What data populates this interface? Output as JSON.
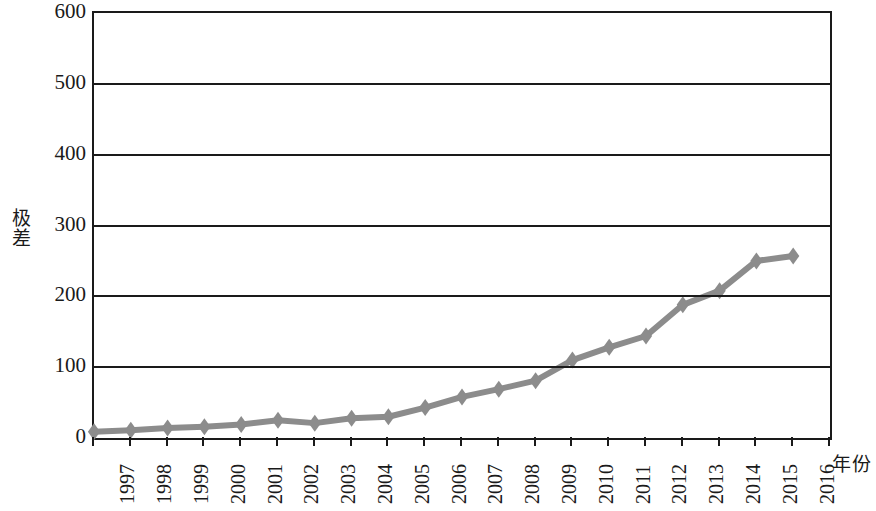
{
  "chart_data": {
    "type": "line",
    "title": "",
    "subtitle": "",
    "xlabel": "年份",
    "ylabel": "极差",
    "categories": [
      "1997",
      "1998",
      "1999",
      "2000",
      "2001",
      "2002",
      "2003",
      "2004",
      "2005",
      "2006",
      "2007",
      "2008",
      "2009",
      "2010",
      "2011",
      "2012",
      "2013",
      "2014",
      "2015",
      "2016"
    ],
    "values": [
      9,
      11,
      14,
      16,
      19,
      25,
      21,
      28,
      30,
      43,
      58,
      69,
      81,
      110,
      128,
      144,
      188,
      208,
      250,
      257
    ],
    "series": [
      {
        "name": "极差",
        "values": [
          9,
          11,
          14,
          16,
          19,
          25,
          21,
          28,
          30,
          43,
          58,
          69,
          81,
          110,
          128,
          144,
          188,
          208,
          250,
          257
        ]
      }
    ],
    "ylim": [
      0,
      600
    ],
    "yticks": [
      0,
      100,
      200,
      300,
      400,
      500,
      600
    ],
    "ytick_labels": [
      "0",
      "100",
      "200",
      "300",
      "400",
      "500",
      "600"
    ],
    "grid": "horizontal",
    "legend": "none",
    "marker": "diamond",
    "line_color": "#8c8c8c",
    "marker_color": "#8c8c8c",
    "axis_color": "#1a1a1a",
    "background_color": "#ffffff"
  }
}
